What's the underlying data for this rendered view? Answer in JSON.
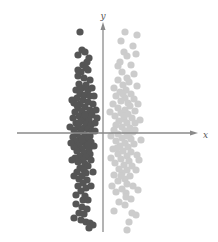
{
  "chart_data": {
    "type": "scatter",
    "title": "",
    "xlabel": "x",
    "ylabel": "y",
    "grid": false,
    "legend": null,
    "note": "Two vertically elongated clusters on either side of the y-axis; no ticks or numeric labels. Coordinates are in pixel space of the 218x242 figure (origin at axis crossing ~ (103,133)); values estimated visually.",
    "axes": {
      "origin_px": [
        103,
        133
      ],
      "x_axis_px": {
        "x1": 17,
        "x2": 198,
        "y": 133
      },
      "y_axis_px": {
        "x": 103,
        "y1": 232,
        "y2": 22
      },
      "x_label_pos": [
        203,
        135
      ],
      "y_label_pos": [
        103,
        16
      ],
      "color": "#8a8a8a"
    },
    "series": [
      {
        "name": "left cluster (dark)",
        "color": "#555555",
        "radius": 3.6,
        "points": [
          [
            80,
            32
          ],
          [
            82,
            50
          ],
          [
            85,
            52
          ],
          [
            78,
            55
          ],
          [
            89,
            58
          ],
          [
            83,
            65
          ],
          [
            86,
            68
          ],
          [
            81,
            72
          ],
          [
            78,
            76
          ],
          [
            88,
            70
          ],
          [
            84,
            78
          ],
          [
            90,
            80
          ],
          [
            79,
            84
          ],
          [
            86,
            85
          ],
          [
            82,
            88
          ],
          [
            76,
            90
          ],
          [
            88,
            90
          ],
          [
            92,
            88
          ],
          [
            80,
            94
          ],
          [
            85,
            95
          ],
          [
            90,
            96
          ],
          [
            77,
            98
          ],
          [
            83,
            100
          ],
          [
            88,
            102
          ],
          [
            74,
            103
          ],
          [
            80,
            104
          ],
          [
            93,
            104
          ],
          [
            85,
            107
          ],
          [
            78,
            108
          ],
          [
            90,
            110
          ],
          [
            82,
            111
          ],
          [
            75,
            112
          ],
          [
            87,
            114
          ],
          [
            92,
            115
          ],
          [
            79,
            116
          ],
          [
            84,
            118
          ],
          [
            73,
            118
          ],
          [
            89,
            120
          ],
          [
            81,
            121
          ],
          [
            76,
            123
          ],
          [
            86,
            124
          ],
          [
            91,
            125
          ],
          [
            78,
            127
          ],
          [
            84,
            128
          ],
          [
            88,
            129
          ],
          [
            74,
            130
          ],
          [
            81,
            131
          ],
          [
            92,
            131
          ],
          [
            77,
            134
          ],
          [
            85,
            135
          ],
          [
            90,
            136
          ],
          [
            73,
            137
          ],
          [
            80,
            138
          ],
          [
            87,
            139
          ],
          [
            76,
            141
          ],
          [
            83,
            142
          ],
          [
            91,
            142
          ],
          [
            79,
            145
          ],
          [
            86,
            146
          ],
          [
            74,
            147
          ],
          [
            82,
            149
          ],
          [
            89,
            149
          ],
          [
            77,
            151
          ],
          [
            84,
            153
          ],
          [
            90,
            154
          ],
          [
            80,
            156
          ],
          [
            86,
            157
          ],
          [
            75,
            158
          ],
          [
            83,
            160
          ],
          [
            91,
            160
          ],
          [
            78,
            162
          ],
          [
            85,
            164
          ],
          [
            88,
            166
          ],
          [
            80,
            168
          ],
          [
            84,
            170
          ],
          [
            77,
            172
          ],
          [
            86,
            173
          ],
          [
            82,
            176
          ],
          [
            79,
            179
          ],
          [
            87,
            180
          ],
          [
            83,
            183
          ],
          [
            78,
            186
          ],
          [
            86,
            188
          ],
          [
            81,
            191
          ],
          [
            85,
            196
          ],
          [
            83,
            200
          ],
          [
            76,
            204
          ],
          [
            82,
            207
          ],
          [
            87,
            209
          ],
          [
            79,
            213
          ],
          [
            84,
            214
          ],
          [
            81,
            220
          ],
          [
            86,
            222
          ],
          [
            90,
            223
          ],
          [
            93,
            225
          ],
          [
            89,
            228
          ],
          [
            72,
            100
          ],
          [
            94,
            96
          ],
          [
            96,
            110
          ],
          [
            70,
            127
          ],
          [
            95,
            123
          ],
          [
            71,
            143
          ],
          [
            94,
            146
          ],
          [
            72,
            160
          ],
          [
            93,
            172
          ],
          [
            74,
            176
          ],
          [
            91,
            186
          ],
          [
            76,
            195
          ],
          [
            88,
            200
          ],
          [
            74,
            218
          ],
          [
            95,
            131
          ],
          [
            97,
            118
          ],
          [
            78,
            70
          ],
          [
            87,
            62
          ],
          [
            80,
            90
          ],
          [
            82,
            140
          ],
          [
            88,
            145
          ],
          [
            79,
            123
          ],
          [
            85,
            115
          ],
          [
            77,
            105
          ]
        ]
      },
      {
        "name": "right cluster (light)",
        "color": "#cccccc",
        "radius": 3.6,
        "points": [
          [
            125,
            32
          ],
          [
            137,
            35
          ],
          [
            121,
            41
          ],
          [
            124,
            52
          ],
          [
            127,
            56
          ],
          [
            136,
            54
          ],
          [
            118,
            66
          ],
          [
            131,
            65
          ],
          [
            122,
            72
          ],
          [
            134,
            74
          ],
          [
            127,
            78
          ],
          [
            118,
            80
          ],
          [
            129,
            82
          ],
          [
            123,
            85
          ],
          [
            114,
            88
          ],
          [
            137,
            86
          ],
          [
            126,
            90
          ],
          [
            120,
            92
          ],
          [
            131,
            94
          ],
          [
            116,
            96
          ],
          [
            125,
            98
          ],
          [
            134,
            99
          ],
          [
            121,
            101
          ],
          [
            128,
            103
          ],
          [
            113,
            104
          ],
          [
            130,
            106
          ],
          [
            118,
            108
          ],
          [
            125,
            110
          ],
          [
            135,
            111
          ],
          [
            121,
            113
          ],
          [
            128,
            114
          ],
          [
            115,
            116
          ],
          [
            132,
            118
          ],
          [
            124,
            119
          ],
          [
            119,
            121
          ],
          [
            127,
            123
          ],
          [
            135,
            123
          ],
          [
            116,
            125
          ],
          [
            122,
            127
          ],
          [
            130,
            128
          ],
          [
            114,
            130
          ],
          [
            125,
            131
          ],
          [
            133,
            132
          ],
          [
            118,
            134
          ],
          [
            127,
            136
          ],
          [
            111,
            136
          ],
          [
            122,
            138
          ],
          [
            131,
            139
          ],
          [
            116,
            141
          ],
          [
            125,
            143
          ],
          [
            134,
            144
          ],
          [
            120,
            146
          ],
          [
            128,
            147
          ],
          [
            113,
            149
          ],
          [
            123,
            151
          ],
          [
            131,
            152
          ],
          [
            118,
            154
          ],
          [
            127,
            156
          ],
          [
            137,
            155
          ],
          [
            121,
            159
          ],
          [
            129,
            161
          ],
          [
            115,
            163
          ],
          [
            124,
            165
          ],
          [
            132,
            166
          ],
          [
            119,
            169
          ],
          [
            127,
            170
          ],
          [
            122,
            173
          ],
          [
            114,
            175
          ],
          [
            130,
            176
          ],
          [
            125,
            179
          ],
          [
            118,
            181
          ],
          [
            127,
            184
          ],
          [
            133,
            186
          ],
          [
            122,
            189
          ],
          [
            116,
            192
          ],
          [
            126,
            193
          ],
          [
            131,
            199
          ],
          [
            119,
            202
          ],
          [
            125,
            205
          ],
          [
            114,
            211
          ],
          [
            132,
            213
          ],
          [
            136,
            215
          ],
          [
            129,
            222
          ],
          [
            127,
            230
          ],
          [
            140,
            120
          ],
          [
            138,
            104
          ],
          [
            141,
            140
          ],
          [
            139,
            160
          ],
          [
            110,
            112
          ],
          [
            111,
            158
          ],
          [
            136,
            170
          ],
          [
            112,
            186
          ],
          [
            138,
            190
          ],
          [
            120,
            62
          ],
          [
            133,
            46
          ],
          [
            124,
            116
          ],
          [
            117,
            148
          ],
          [
            129,
            134
          ],
          [
            121,
            176
          ],
          [
            126,
            197
          ],
          [
            135,
            130
          ],
          [
            123,
            94
          ]
        ]
      }
    ]
  }
}
